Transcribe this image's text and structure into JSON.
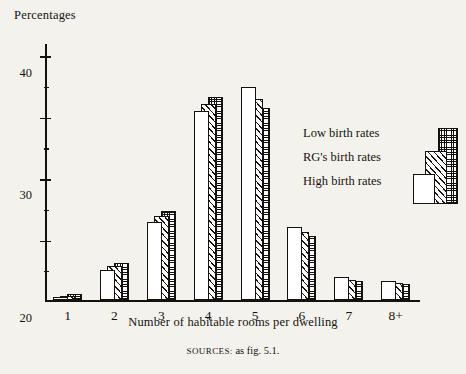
{
  "chart_data": {
    "type": "bar",
    "title": "",
    "ylabel": "Percentages",
    "xlabel": "Number of habitable rooms per dwelling",
    "categories": [
      "1",
      "2",
      "3",
      "4",
      "5",
      "6",
      "7",
      "8+"
    ],
    "ylim": [
      0,
      42
    ],
    "yticks": [
      10,
      20,
      30,
      40
    ],
    "ytick_labels": [
      "10",
      "20",
      "30",
      "40"
    ],
    "grid": false,
    "legend_position": "right",
    "series": [
      {
        "name": "High birth rates",
        "pattern": "blank-white",
        "values": [
          0.6,
          5.0,
          12.8,
          30.8,
          34.7,
          11.9,
          3.8,
          3.2
        ]
      },
      {
        "name": "RG's birth rates",
        "pattern": "diagonal-hatch",
        "values": [
          0.8,
          5.6,
          13.8,
          31.9,
          32.8,
          11.1,
          3.4,
          2.9
        ]
      },
      {
        "name": "Low birth rates",
        "pattern": "cross-hatch-dotted",
        "values": [
          1.0,
          6.1,
          14.5,
          33.1,
          31.3,
          10.5,
          3.1,
          2.6
        ]
      }
    ],
    "source_prefix": "SOURCES:",
    "source_text": " as fig. 5.1."
  },
  "legend": {
    "items": [
      {
        "label": "Low birth rates"
      },
      {
        "label": "RG's birth rates"
      },
      {
        "label": "High birth rates"
      }
    ]
  },
  "colors": {
    "ink": "#14110e",
    "paper": "#f4f2ed",
    "bar_fill": "#ffffff"
  }
}
